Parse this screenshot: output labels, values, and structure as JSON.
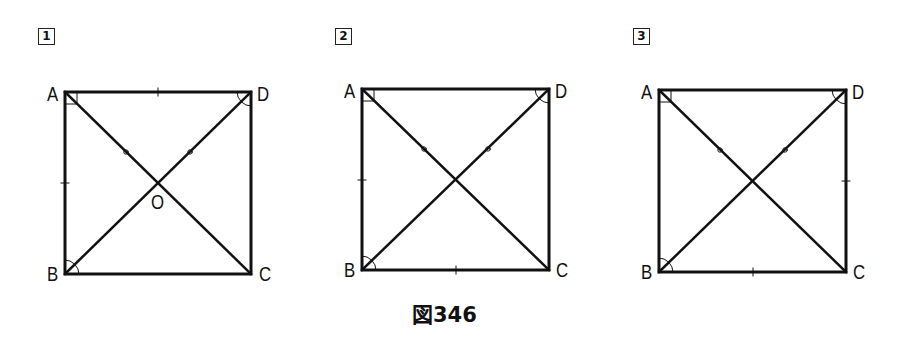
{
  "caption": "図346",
  "figures": [
    {
      "number": "1",
      "vertices": {
        "A": "A",
        "B": "B",
        "C": "C",
        "D": "D"
      },
      "center_label": "O",
      "side_ticks": [
        "AD",
        "AB"
      ],
      "angle_marks": {
        "A": "right-angle",
        "B": "arc",
        "D": "arc"
      },
      "diagonal_marks": [
        "AO",
        "DO"
      ]
    },
    {
      "number": "2",
      "vertices": {
        "A": "A",
        "B": "B",
        "C": "C",
        "D": "D"
      },
      "side_ticks": [
        "AB",
        "BC"
      ],
      "angle_marks": {
        "A": "right-angle",
        "B": "arc",
        "D": "arc"
      },
      "diagonal_marks": [
        "AO",
        "DO"
      ]
    },
    {
      "number": "3",
      "vertices": {
        "A": "A",
        "B": "B",
        "C": "C",
        "D": "D"
      },
      "side_ticks": [
        "DC",
        "BC"
      ],
      "angle_marks": {
        "A": "right-angle",
        "B": "arc",
        "D": "arc"
      },
      "diagonal_marks": [
        "AO",
        "DO"
      ]
    }
  ]
}
